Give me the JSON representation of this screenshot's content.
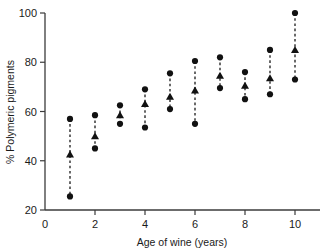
{
  "chart_data": {
    "type": "scatter",
    "title": "",
    "xlabel": "Age of wine (years)",
    "ylabel": "% Polymeric pigments",
    "xlim": [
      0,
      11
    ],
    "ylim": [
      20,
      100
    ],
    "xticks": [
      0,
      2,
      4,
      6,
      8,
      10
    ],
    "yticks": [
      20,
      40,
      60,
      80,
      100
    ],
    "grid": false,
    "legend": "none",
    "x": [
      1,
      2,
      3,
      4,
      5,
      6,
      7,
      8,
      9,
      10
    ],
    "series": [
      {
        "name": "Maximum",
        "marker": "circle",
        "values": [
          57,
          58.5,
          62.5,
          69,
          75.5,
          80.5,
          82,
          76,
          85,
          100
        ]
      },
      {
        "name": "Mean",
        "marker": "triangle",
        "values": [
          42.5,
          50,
          58.5,
          63,
          66,
          68.5,
          74.5,
          70.5,
          73.5,
          85
        ]
      },
      {
        "name": "Minimum",
        "marker": "circle",
        "values": [
          25.5,
          45,
          55,
          53.5,
          61,
          55,
          69.5,
          65,
          67,
          73
        ]
      }
    ]
  },
  "axes": {
    "x_tick_labels": [
      "0",
      "2",
      "4",
      "6",
      "8",
      "10"
    ],
    "y_tick_labels": [
      "20",
      "40",
      "60",
      "80",
      "100"
    ],
    "x_title": "Age of wine (years)",
    "y_title": "% Polymeric pigments"
  },
  "colors": {
    "marker": "#111111",
    "axis": "#3b3b3b",
    "background": "#ffffff"
  }
}
